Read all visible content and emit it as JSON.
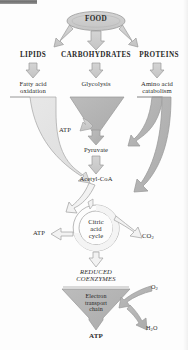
{
  "figure": {
    "kind": "metabolic-pathway-diagram",
    "background_color": "#fdfdfd",
    "fill_light": "#e2e2e2",
    "fill_mid": "#cfcfcf",
    "fill_dark": "#b4b4b4",
    "stroke_color": "#9a9a9a",
    "text_color": "#2a2a2a"
  },
  "artifacts": {
    "scan_bar_present": true
  },
  "top": {
    "source_label": "FOOD"
  },
  "classes": [
    {
      "id": "lipids",
      "heading": "LIPIDS",
      "process": "Fatty acid\noxidation"
    },
    {
      "id": "carbohydrates",
      "heading": "CARBOHYDRATES",
      "process": "Glycolysis"
    },
    {
      "id": "proteins",
      "heading": "PROTEINS",
      "process": "Amino acid\ncatabolism"
    }
  ],
  "intermediates": {
    "pyruvate": "Pyruvate",
    "acetyl_coa": "Acetyl-CoA",
    "reduced_coenzymes": "REDUCED\nCOENZYMES"
  },
  "cycle": {
    "label": "Citric\nacid\ncycle"
  },
  "final_stage": {
    "label": "Electron\ntransport\nchain"
  },
  "outputs": {
    "atp_glycolysis": "ATP",
    "atp_cycle": "ATP",
    "atp_etc": "ATP",
    "co2": "CO",
    "co2_sub": "2",
    "o2": "O",
    "o2_sub": "2",
    "h2o_h": "H",
    "h2o_sub": "2",
    "h2o_o": "O"
  }
}
